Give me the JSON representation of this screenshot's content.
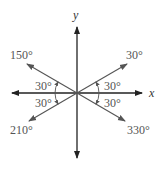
{
  "diagram": {
    "axes": {
      "x_label": "x",
      "y_label": "y"
    },
    "rays": [
      {
        "angle_deg": 30,
        "label": "30°"
      },
      {
        "angle_deg": 150,
        "label": "150°"
      },
      {
        "angle_deg": 210,
        "label": "210°"
      },
      {
        "angle_deg": 330,
        "label": "330°"
      }
    ],
    "angle_marks": [
      {
        "quadrant": "I",
        "label": "30°"
      },
      {
        "quadrant": "II",
        "label": "30°"
      },
      {
        "quadrant": "III",
        "label": "30°"
      },
      {
        "quadrant": "IV",
        "label": "30°"
      }
    ],
    "colors": {
      "axis": "#111111",
      "ray": "#555555",
      "text": "#555555"
    }
  }
}
